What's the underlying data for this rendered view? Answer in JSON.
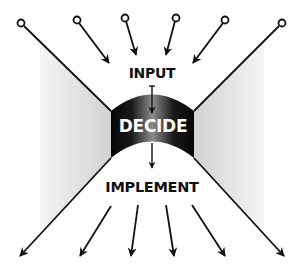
{
  "diagram": {
    "labels": {
      "input": "INPUT",
      "decide": "DECIDE",
      "implement": "IMPLEMENT"
    },
    "colors": {
      "line": "#111111",
      "decide_fill_dark": "#0a0a0a",
      "decide_fill_light": "#8a8a8a",
      "funnel_shade": "#d6d6d6",
      "background": "#ffffff"
    },
    "inputs": [
      {
        "id": "input-1",
        "start": [
          21,
          23
        ],
        "end": [
          111,
          111
        ],
        "arrow": false
      },
      {
        "id": "input-2",
        "start": [
          77,
          20
        ],
        "end": [
          109,
          63
        ],
        "arrow": true
      },
      {
        "id": "input-3",
        "start": [
          125,
          18
        ],
        "end": [
          137,
          55
        ],
        "arrow": true
      },
      {
        "id": "input-4",
        "start": [
          176,
          18
        ],
        "end": [
          166,
          55
        ],
        "arrow": true
      },
      {
        "id": "input-5",
        "start": [
          225,
          20
        ],
        "end": [
          193,
          63
        ],
        "arrow": true
      },
      {
        "id": "input-6",
        "start": [
          282,
          23
        ],
        "end": [
          194,
          111
        ],
        "arrow": false
      }
    ],
    "outputs": [
      {
        "id": "output-1",
        "start": [
          111,
          158
        ],
        "end": [
          19,
          257
        ]
      },
      {
        "id": "output-2",
        "start": [
          111,
          206
        ],
        "end": [
          79,
          257
        ]
      },
      {
        "id": "output-3",
        "start": [
          138,
          205
        ],
        "end": [
          131,
          257
        ]
      },
      {
        "id": "output-4",
        "start": [
          166,
          205
        ],
        "end": [
          174,
          257
        ]
      },
      {
        "id": "output-5",
        "start": [
          192,
          205
        ],
        "end": [
          226,
          257
        ]
      },
      {
        "id": "output-6",
        "start": [
          194,
          158
        ],
        "end": [
          285,
          257
        ]
      }
    ]
  }
}
